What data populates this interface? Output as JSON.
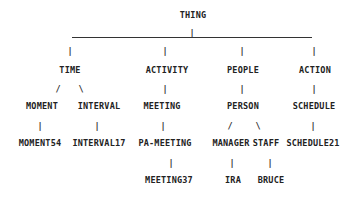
{
  "diagram": {
    "type": "tree",
    "root": "THING",
    "nodes": [
      {
        "id": "thing",
        "label": "THING",
        "x": 193,
        "y": 15
      },
      {
        "id": "time",
        "label": "TIME",
        "x": 70,
        "y": 70
      },
      {
        "id": "activity",
        "label": "ACTIVITY",
        "x": 167,
        "y": 70
      },
      {
        "id": "people",
        "label": "PEOPLE",
        "x": 243,
        "y": 70
      },
      {
        "id": "action",
        "label": "ACTION",
        "x": 315,
        "y": 70
      },
      {
        "id": "moment",
        "label": "MOMENT",
        "x": 42,
        "y": 106
      },
      {
        "id": "interval",
        "label": "INTERVAL",
        "x": 99,
        "y": 106
      },
      {
        "id": "meeting",
        "label": "MEETING",
        "x": 162,
        "y": 106
      },
      {
        "id": "person",
        "label": "PERSON",
        "x": 243,
        "y": 106
      },
      {
        "id": "schedule",
        "label": "SCHEDULE",
        "x": 314,
        "y": 106
      },
      {
        "id": "moment54",
        "label": "MOMENT54",
        "x": 40,
        "y": 143
      },
      {
        "id": "interval17",
        "label": "INTERVAL17",
        "x": 99,
        "y": 143
      },
      {
        "id": "pa-meeting",
        "label": "PA-MEETING",
        "x": 165,
        "y": 143
      },
      {
        "id": "manager",
        "label": "MANAGER",
        "x": 231,
        "y": 143
      },
      {
        "id": "staff",
        "label": "STAFF",
        "x": 266,
        "y": 143
      },
      {
        "id": "schedule21",
        "label": "SCHEDULE21",
        "x": 313,
        "y": 143
      },
      {
        "id": "meeting37",
        "label": "MEETING37",
        "x": 169,
        "y": 180
      },
      {
        "id": "ira",
        "label": "IRA",
        "x": 233,
        "y": 180
      },
      {
        "id": "bruce",
        "label": "BRUCE",
        "x": 271,
        "y": 180
      }
    ],
    "edges": [
      [
        "thing",
        "time"
      ],
      [
        "thing",
        "activity"
      ],
      [
        "thing",
        "people"
      ],
      [
        "thing",
        "action"
      ],
      [
        "time",
        "moment"
      ],
      [
        "time",
        "interval"
      ],
      [
        "activity",
        "meeting"
      ],
      [
        "people",
        "person"
      ],
      [
        "action",
        "schedule"
      ],
      [
        "moment",
        "moment54"
      ],
      [
        "interval",
        "interval17"
      ],
      [
        "meeting",
        "pa-meeting"
      ],
      [
        "person",
        "manager"
      ],
      [
        "person",
        "staff"
      ],
      [
        "schedule",
        "schedule21"
      ],
      [
        "pa-meeting",
        "meeting37"
      ],
      [
        "manager",
        "ira"
      ],
      [
        "staff",
        "bruce"
      ]
    ],
    "connectors": [
      {
        "glyph": "|",
        "x": 192,
        "y": 33
      },
      {
        "glyph": "|",
        "x": 70,
        "y": 51
      },
      {
        "glyph": "|",
        "x": 165,
        "y": 51
      },
      {
        "glyph": "|",
        "x": 242,
        "y": 51
      },
      {
        "glyph": "|",
        "x": 314,
        "y": 51
      },
      {
        "glyph": "/",
        "x": 58,
        "y": 89
      },
      {
        "glyph": "\\",
        "x": 81,
        "y": 89
      },
      {
        "glyph": "|",
        "x": 165,
        "y": 89
      },
      {
        "glyph": "|",
        "x": 242,
        "y": 89
      },
      {
        "glyph": "|",
        "x": 314,
        "y": 89
      },
      {
        "glyph": "|",
        "x": 40,
        "y": 126
      },
      {
        "glyph": "|",
        "x": 97,
        "y": 126
      },
      {
        "glyph": "|",
        "x": 163,
        "y": 126
      },
      {
        "glyph": "/",
        "x": 230,
        "y": 126
      },
      {
        "glyph": "\\",
        "x": 258,
        "y": 126
      },
      {
        "glyph": "|",
        "x": 313,
        "y": 126
      },
      {
        "glyph": "|",
        "x": 171,
        "y": 163
      },
      {
        "glyph": "|",
        "x": 232,
        "y": 163
      },
      {
        "glyph": "|",
        "x": 270,
        "y": 163
      }
    ],
    "hline": {
      "x1": 72,
      "x2": 312,
      "y": 37
    }
  }
}
